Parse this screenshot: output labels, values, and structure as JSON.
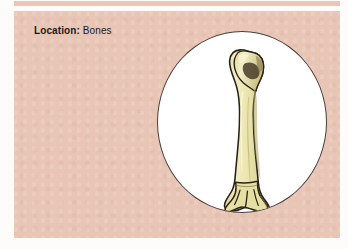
{
  "panel": {
    "background_color": "#e8c5b5",
    "top_strip_color": "#e9c6b6"
  },
  "caption": {
    "label": "Location:",
    "value": "Bones",
    "text_color": "#1c1a19"
  },
  "illustration": {
    "name": "long-bone-humerus",
    "shape": "circle",
    "circle_fill": "#ffffff",
    "circle_border_color": "#4a3f3a",
    "bone_fill": "#e9e3a9",
    "bone_outline": "#2a2118",
    "bone_shadow": "#bdb276",
    "bone_highlight": "#f6f2cf"
  }
}
